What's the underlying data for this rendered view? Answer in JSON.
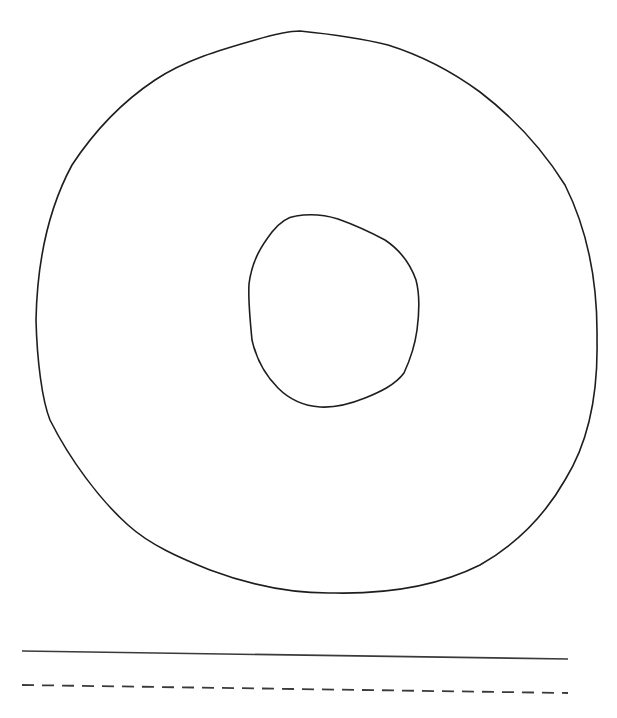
{
  "figure": {
    "description": "Hand-drawn letter O tracing worksheet",
    "shape": "letter-o-ring",
    "stroke_color": "#1e1e1e",
    "background_color": "#ffffff",
    "outer_ring": {
      "left": 36,
      "top": 31,
      "right": 597,
      "bottom": 594
    },
    "inner_ring": {
      "left": 248,
      "top": 214,
      "right": 419,
      "bottom": 408
    }
  },
  "writing_lines": [
    {
      "style": "solid",
      "x1": 22,
      "y1": 651,
      "x2": 568,
      "y2": 659,
      "color": "#3a3a3a"
    },
    {
      "style": "dashed",
      "x1": 22,
      "y1": 685,
      "x2": 568,
      "y2": 693,
      "color": "#3a3a3a"
    }
  ]
}
